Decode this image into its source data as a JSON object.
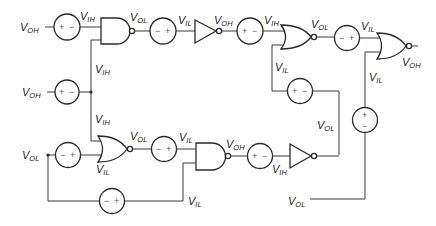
{
  "diagram": {
    "type": "logic-gate noise-margin circuit",
    "labels": {
      "in_top": {
        "v": "V",
        "s": "OH"
      },
      "in_mid": {
        "v": "V",
        "s": "OH"
      },
      "in_low": {
        "v": "V",
        "s": "OL"
      },
      "in_bottom_right": {
        "v": "V",
        "s": "OL"
      },
      "nand1_in1": {
        "v": "V",
        "s": "IH"
      },
      "nand1_in2": {
        "v": "V",
        "s": "IH"
      },
      "nand1_out": {
        "v": "V",
        "s": "OL"
      },
      "inv1_in": {
        "v": "V",
        "s": "IL"
      },
      "inv1_out": {
        "v": "V",
        "s": "OH"
      },
      "nor1_in1": {
        "v": "V",
        "s": "IH"
      },
      "nor1_in2": {
        "v": "V",
        "s": "IL"
      },
      "nor1_out": {
        "v": "V",
        "s": "OL"
      },
      "nor2_in1": {
        "v": "V",
        "s": "IL"
      },
      "nor2_in2": {
        "v": "V",
        "s": "IL"
      },
      "nor2_out": {
        "v": "V",
        "s": "OH"
      },
      "nor3_in1": {
        "v": "V",
        "s": "IH"
      },
      "nor3_in2": {
        "v": "V",
        "s": "IL"
      },
      "nor3_out": {
        "v": "V",
        "s": "OL"
      },
      "nand2_in1": {
        "v": "V",
        "s": "IL"
      },
      "nand2_in2": {
        "v": "V",
        "s": "IL"
      },
      "nand2_out": {
        "v": "V",
        "s": "OH"
      },
      "inv2_in": {
        "v": "V",
        "s": "IH"
      },
      "inv2_out": {
        "v": "V",
        "s": "OL"
      }
    },
    "sources": {
      "s1": {
        "left": "+",
        "right": "−"
      },
      "s2": {
        "left": "−",
        "right": "+"
      },
      "s3": {
        "left": "+",
        "right": "−"
      },
      "s4": {
        "left": "−",
        "right": "+"
      },
      "s5": {
        "left": "+",
        "right": "−"
      },
      "s6": {
        "left": "+",
        "right": "−"
      },
      "s7": {
        "left": "−",
        "right": "+"
      },
      "s8": {
        "left": "−",
        "right": "+"
      },
      "s9": {
        "left": "+",
        "right": "−"
      },
      "s10": {
        "left": "−",
        "right": "+"
      },
      "s11": {
        "top": "+",
        "bottom": "−"
      }
    }
  }
}
